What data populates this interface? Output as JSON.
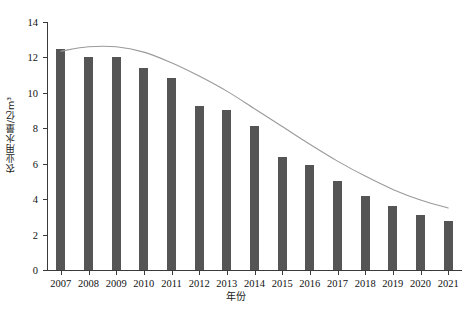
{
  "chart_data": {
    "type": "bar",
    "title": "",
    "xlabel": "年份",
    "ylabel": "农业用水量/亿m³",
    "categories": [
      "2007",
      "2008",
      "2009",
      "2010",
      "2011",
      "2012",
      "2013",
      "2014",
      "2015",
      "2016",
      "2017",
      "2018",
      "2019",
      "2020",
      "2021"
    ],
    "values": [
      12.45,
      12.0,
      12.0,
      11.4,
      10.85,
      9.25,
      9.05,
      8.15,
      6.4,
      5.95,
      5.0,
      4.15,
      3.6,
      3.1,
      2.75
    ],
    "series": [
      {
        "name": "农业用水量",
        "type": "bar",
        "values": [
          12.45,
          12.0,
          12.0,
          11.4,
          10.85,
          9.25,
          9.05,
          8.15,
          6.4,
          5.95,
          5.0,
          4.15,
          3.6,
          3.1,
          2.75
        ]
      },
      {
        "name": "趋势线",
        "type": "line",
        "values": [
          12.35,
          12.6,
          12.6,
          12.3,
          11.7,
          10.95,
          10.1,
          9.1,
          8.1,
          7.1,
          6.15,
          5.3,
          4.55,
          3.95,
          3.5
        ]
      }
    ],
    "ylim": [
      0,
      14
    ],
    "yticks": [
      0,
      2,
      4,
      6,
      8,
      10,
      12,
      14
    ],
    "ytick_labels": [
      "0",
      "2",
      "4",
      "6",
      "8",
      "10",
      "12",
      "14"
    ],
    "xtick_labels": [
      "2007",
      "2008",
      "2009",
      "2010",
      "2011",
      "2012",
      "2013",
      "2014",
      "2015",
      "2016",
      "2017",
      "2018",
      "2019",
      "2020",
      "2021"
    ],
    "grid": false,
    "legend": "none",
    "colors": {
      "bar": "#555555",
      "trend_line": "#9a9a9a",
      "axis": "#3a3a3a",
      "text": "#111111",
      "background": "#ffffff"
    }
  }
}
